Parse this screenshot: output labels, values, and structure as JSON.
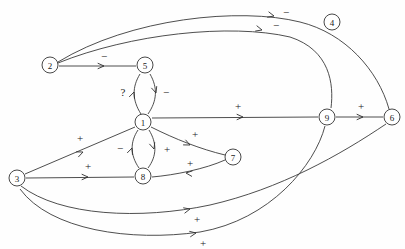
{
  "diagram": {
    "type": "signed-directed-graph",
    "title": "",
    "width": 405,
    "height": 249,
    "background_color": "#fefefe",
    "stroke_color": "#3a3a3a",
    "node_fill": "#ffffff",
    "node_radius": 8,
    "nodes": [
      {
        "id": "2",
        "label": "2",
        "x": 50,
        "y": 65,
        "isolated": false
      },
      {
        "id": "5",
        "label": "5",
        "x": 145,
        "y": 65,
        "isolated": false
      },
      {
        "id": "1",
        "label": "1",
        "x": 143,
        "y": 122,
        "isolated": false
      },
      {
        "id": "8",
        "label": "8",
        "x": 143,
        "y": 176,
        "isolated": false
      },
      {
        "id": "7",
        "label": "7",
        "x": 233,
        "y": 157,
        "isolated": false
      },
      {
        "id": "9",
        "label": "9",
        "x": 327,
        "y": 117,
        "isolated": false
      },
      {
        "id": "6",
        "label": "6",
        "x": 392,
        "y": 117,
        "isolated": false
      },
      {
        "id": "3",
        "label": "3",
        "x": 17,
        "y": 178,
        "isolated": false
      },
      {
        "id": "4",
        "label": "4",
        "x": 332,
        "y": 22,
        "isolated": true
      }
    ],
    "edges": [
      {
        "id": "e-2-5",
        "from": "2",
        "to": "5",
        "sign": "-",
        "path": "M 59 66 L 136 66",
        "arrow": {
          "x": 104,
          "y": 66,
          "angle": 0
        },
        "label": {
          "x": 104,
          "y": 56
        }
      },
      {
        "id": "e-2-6",
        "from": "2",
        "to": "6",
        "sign": "-",
        "path": "M 58 62 C 130 18, 240 7, 300 22 C 345 33, 378 70, 389 109",
        "arrow": {
          "x": 274,
          "y": 16,
          "angle": 14
        },
        "label": {
          "x": 286,
          "y": 12
        }
      },
      {
        "id": "e-2-9",
        "from": "2",
        "to": "9",
        "sign": "-",
        "path": "M 58 63 C 130 34, 230 23, 290 37 C 330 50, 334 84, 331 108",
        "arrow": {
          "x": 262,
          "y": 30,
          "angle": 15
        },
        "label": {
          "x": 276,
          "y": 25
        }
      },
      {
        "id": "e-5-1-up",
        "from": "1",
        "to": "5",
        "sign": "?",
        "path": "M 141 114 C 132 100, 132 87, 140 74",
        "arrow": {
          "x": 134,
          "y": 92,
          "angle": -70
        },
        "label": {
          "x": 123,
          "y": 92
        }
      },
      {
        "id": "e-5-1-down",
        "from": "5",
        "to": "1",
        "sign": "-",
        "path": "M 150 74 C 158 88, 157 101, 148 114",
        "arrow": {
          "x": 156,
          "y": 93,
          "angle": 72
        },
        "label": {
          "x": 166,
          "y": 92
        }
      },
      {
        "id": "e-1-8-up",
        "from": "8",
        "to": "1",
        "sign": "-",
        "path": "M 139 168 C 130 155, 130 142, 138 130",
        "arrow": {
          "x": 132,
          "y": 148,
          "angle": -70
        },
        "label": {
          "x": 120,
          "y": 148
        }
      },
      {
        "id": "e-1-8-down",
        "from": "1",
        "to": "8",
        "sign": "+",
        "path": "M 149 130 C 157 143, 157 156, 148 168",
        "arrow": {
          "x": 154,
          "y": 149,
          "angle": 72
        },
        "label": {
          "x": 167,
          "y": 149
        }
      },
      {
        "id": "e-1-7",
        "from": "1",
        "to": "7",
        "sign": "+",
        "path": "M 151 127 C 175 139, 200 149, 225 155",
        "arrow": {
          "x": 190,
          "y": 145,
          "angle": 25
        },
        "label": {
          "x": 195,
          "y": 134
        }
      },
      {
        "id": "e-7-8",
        "from": "7",
        "to": "8",
        "sign": "+",
        "path": "M 225 160 C 205 169, 175 175, 152 177",
        "arrow": {
          "x": 186,
          "y": 173,
          "angle": 186
        },
        "label": {
          "x": 190,
          "y": 163
        }
      },
      {
        "id": "e-1-9",
        "from": "1",
        "to": "9",
        "sign": "+",
        "path": "M 152 118 L 318 117",
        "arrow": {
          "x": 243,
          "y": 117,
          "angle": 0
        },
        "label": {
          "x": 238,
          "y": 106
        }
      },
      {
        "id": "e-9-6",
        "from": "9",
        "to": "6",
        "sign": "+",
        "path": "M 336 117 L 383 117",
        "arrow": {
          "x": 363,
          "y": 117,
          "angle": 0
        },
        "label": {
          "x": 361,
          "y": 106
        }
      },
      {
        "id": "e-3-1",
        "from": "3",
        "to": "1",
        "sign": "+",
        "path": "M 25 174 L 135 127",
        "arrow": {
          "x": 83,
          "y": 152,
          "angle": -23
        },
        "label": {
          "x": 80,
          "y": 138
        }
      },
      {
        "id": "e-3-8",
        "from": "3",
        "to": "8",
        "sign": "+",
        "path": "M 26 178 L 134 177",
        "arrow": {
          "x": 88,
          "y": 177,
          "angle": 0
        },
        "label": {
          "x": 88,
          "y": 166
        }
      },
      {
        "id": "e-3-9",
        "from": "3",
        "to": "6",
        "sign": "+",
        "path": "M 21 186 C 60 216, 140 220, 210 205 C 280 189, 340 155, 386 124",
        "arrow": {
          "x": 190,
          "y": 209,
          "angle": -14
        },
        "label": {
          "x": 197,
          "y": 219
        }
      },
      {
        "id": "e-3-6",
        "from": "3",
        "to": "9",
        "sign": "+",
        "path": "M 20 189 C 50 230, 130 242, 200 232 C 270 220, 315 165, 325 126",
        "arrow": {
          "x": 196,
          "y": 233,
          "angle": -10
        },
        "label": {
          "x": 203,
          "y": 243
        }
      }
    ]
  }
}
